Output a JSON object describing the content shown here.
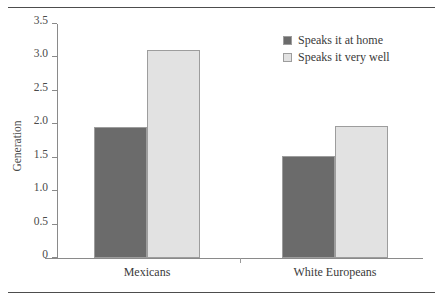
{
  "chart_data": {
    "type": "bar",
    "title": "",
    "xlabel": "",
    "ylabel": "Generation",
    "categories": [
      "Mexicans",
      "White Europeans"
    ],
    "series": [
      {
        "name": "Speaks it at home",
        "values": [
          1.96,
          1.52
        ],
        "color": "#6b6b6b"
      },
      {
        "name": "Speaks it very well",
        "values": [
          3.11,
          1.98
        ],
        "color": "#e2e2e2"
      }
    ],
    "ylim": [
      0,
      3.5
    ],
    "yticks": [
      0,
      0.5,
      1.0,
      1.5,
      2.0,
      2.5,
      3.0,
      3.5
    ],
    "ytick_labels": [
      "0",
      "0.5",
      "1.0",
      "1.5",
      "2.0",
      "2.5",
      "3.0",
      "3.5"
    ],
    "grid": false,
    "legend_position": "top-right",
    "bar_edge_color": "#9d9d9d",
    "axis_color": "#8a8a8a",
    "rule_color": "#4d4d4d"
  }
}
